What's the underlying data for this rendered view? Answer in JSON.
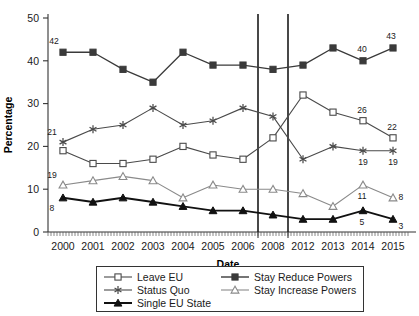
{
  "chart_data": {
    "type": "line",
    "title": "",
    "xlabel": "Date",
    "ylabel": "Percentage",
    "categories": [
      "2000",
      "2001",
      "2002",
      "2003",
      "2004",
      "2005",
      "2006",
      "2008",
      "2012",
      "2013",
      "2014",
      "2015"
    ],
    "ylim": [
      0,
      50
    ],
    "yticks": [
      0,
      10,
      20,
      30,
      40,
      50
    ],
    "ytick_labels": [
      "0",
      "10",
      "20",
      "30",
      "40",
      "50"
    ],
    "grid": false,
    "legend_position": "bottom",
    "annotations": [
      {
        "text": "42",
        "series": "Stay Reduce Powers",
        "category": "2000",
        "value": 42
      },
      {
        "text": "40",
        "series": "Stay Reduce Powers",
        "category": "2014",
        "value": 40
      },
      {
        "text": "43",
        "series": "Stay Reduce Powers",
        "category": "2015",
        "value": 43
      },
      {
        "text": "21",
        "series": "Status Quo",
        "category": "2000",
        "value": 21
      },
      {
        "text": "19",
        "series": "Status Quo",
        "category": "2014",
        "value": 19
      },
      {
        "text": "19",
        "series": "Status Quo",
        "category": "2015",
        "value": 19
      },
      {
        "text": "26",
        "series": "Leave EU",
        "category": "2014",
        "value": 26
      },
      {
        "text": "22",
        "series": "Leave EU",
        "category": "2015",
        "value": 22
      },
      {
        "text": "19",
        "series": "Stay Increase Powers",
        "category": "2000",
        "value": 11
      },
      {
        "text": "11",
        "series": "Stay Increase Powers",
        "category": "2014",
        "value": 11
      },
      {
        "text": "8",
        "series": "Stay Increase Powers",
        "category": "2015",
        "value": 8
      },
      {
        "text": "8",
        "series": "Single EU State",
        "category": "2000",
        "value": 8
      },
      {
        "text": "5",
        "series": "Single EU State",
        "category": "2014",
        "value": 5
      },
      {
        "text": "3",
        "series": "Single EU State",
        "category": "2015",
        "value": 3
      }
    ],
    "reference_lines": [
      {
        "between": [
          "2006",
          "2008"
        ],
        "orientation": "vertical"
      },
      {
        "between": [
          "2008",
          "2012"
        ],
        "orientation": "vertical"
      }
    ],
    "series": [
      {
        "name": "Leave EU",
        "marker": "open-square",
        "color": "#4a4a4a",
        "values": [
          19,
          16,
          16,
          17,
          20,
          18,
          17,
          22,
          32,
          28,
          26,
          22
        ]
      },
      {
        "name": "Stay Reduce Powers",
        "marker": "filled-square",
        "color": "#3a3a3a",
        "values": [
          42,
          42,
          38,
          35,
          42,
          39,
          39,
          38,
          39,
          43,
          40,
          43
        ]
      },
      {
        "name": "Status Quo",
        "marker": "asterisk",
        "color": "#4a4a4a",
        "values": [
          21,
          24,
          25,
          29,
          25,
          26,
          29,
          27,
          17,
          20,
          19,
          19
        ]
      },
      {
        "name": "Stay Increase Powers",
        "marker": "open-triangle",
        "color": "#8a8a8a",
        "values": [
          11,
          12,
          13,
          12,
          8,
          11,
          10,
          10,
          9,
          6,
          11,
          8
        ]
      },
      {
        "name": "Single EU State",
        "marker": "filled-triangle",
        "color": "#111111",
        "values": [
          8,
          7,
          8,
          7,
          6,
          5,
          5,
          4,
          3,
          3,
          5,
          3
        ]
      }
    ]
  },
  "legend": {
    "items": [
      {
        "label": "Leave EU",
        "marker": "open-square",
        "color": "#4a4a4a"
      },
      {
        "label": "Stay Reduce Powers",
        "marker": "filled-square",
        "color": "#3a3a3a"
      },
      {
        "label": "Status Quo",
        "marker": "asterisk",
        "color": "#4a4a4a"
      },
      {
        "label": "Stay Increase Powers",
        "marker": "open-triangle",
        "color": "#8a8a8a"
      },
      {
        "label": "Single EU State",
        "marker": "filled-triangle",
        "color": "#111111"
      }
    ]
  }
}
